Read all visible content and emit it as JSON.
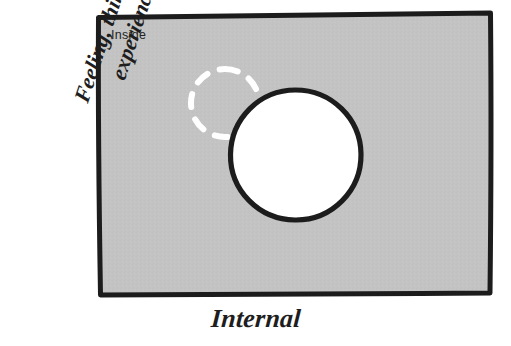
{
  "figure": {
    "type": "conceptual-quadrant-diagram",
    "region_label": "Inside",
    "x_axis_label": "Internal",
    "y_axis_label_line1": "Feeling, thinking,",
    "y_axis_label_line2": "experience",
    "colors": {
      "panel_fill": "#c3c3c3",
      "panel_border": "#1c1c1c",
      "solid_circle_fill": "#ffffff",
      "solid_circle_stroke": "#1c1c1c",
      "dashed_circle_stroke": "#ffffff",
      "text": "#1e1e1e",
      "page_background": "#ffffff"
    },
    "shapes": {
      "panel": {
        "name": "inside-panel",
        "corners_px": [
          [
            98,
            17
          ],
          [
            491,
            13
          ],
          [
            490,
            293
          ],
          [
            100,
            295
          ]
        ]
      },
      "solid_circle": {
        "name": "solid-circle",
        "center_px": [
          295,
          155
        ],
        "radius_px": 65,
        "style": "solid",
        "fill": "white"
      },
      "dashed_circle": {
        "name": "dashed-circle",
        "center_px": [
          225,
          103
        ],
        "radius_px": 34,
        "style": "dashed",
        "fill": "none"
      }
    }
  }
}
